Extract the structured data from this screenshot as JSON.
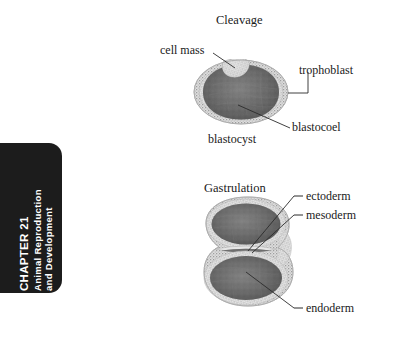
{
  "page": {
    "width": 416,
    "height": 344,
    "background_color": "#ffffff"
  },
  "chapter_tab": {
    "background_color": "#1c1c1c",
    "text_color": "#ffffff",
    "chapter_number": "CHAPTER 21",
    "title_line_1": "Animal Reproduction",
    "title_line_2": "and Development"
  },
  "figures": [
    {
      "id": "cleavage",
      "title": "Cleavage",
      "structure": "blastocyst",
      "labels": [
        {
          "key": "cell_mass",
          "text": "cell mass",
          "leader": "diagonal"
        },
        {
          "key": "trophoblast",
          "text": "trophoblast",
          "leader": "elbow"
        },
        {
          "key": "blastocoel",
          "text": "blastocoel",
          "leader": "diagonal"
        },
        {
          "key": "blastocyst",
          "text": "blastocyst",
          "leader": "none"
        }
      ]
    },
    {
      "id": "gastrulation",
      "title": "Gastrulation",
      "structure": "gastrula",
      "labels": [
        {
          "key": "ectoderm",
          "text": "ectoderm",
          "leader": "dash-line"
        },
        {
          "key": "mesoderm",
          "text": "mesoderm",
          "leader": "dash-line"
        },
        {
          "key": "endoderm",
          "text": "endoderm",
          "leader": "dash-line"
        }
      ]
    }
  ],
  "cleavage": {
    "title": "Cleavage",
    "label_cell_mass": "cell mass",
    "label_trophoblast": "trophoblast",
    "label_blastocoel": "blastocoel",
    "label_blastocyst": "blastocyst"
  },
  "gastrulation": {
    "title": "Gastrulation",
    "label_ectoderm": "ectoderm",
    "label_mesoderm": "mesoderm",
    "label_endoderm": "endoderm"
  },
  "colors": {
    "ink": "#1a1a1a",
    "leader_line": "#2b2b2b",
    "cavity_dark": "#686868",
    "cavity_dark_edge": "#4a4a4a",
    "cavity_highlight": "#8e8e8e",
    "stipple_ring_light": "#d6d6d6",
    "stipple_ring_mid": "#b4b4b4",
    "stipple_dot": "#7a7a7a",
    "tab_black": "#1c1c1c"
  }
}
